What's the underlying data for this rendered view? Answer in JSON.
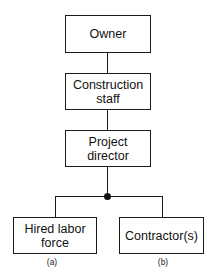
{
  "diagram": {
    "nodes": [
      {
        "id": "owner",
        "label": "Owner"
      },
      {
        "id": "construction_staff",
        "label": "Construction\nstaff"
      },
      {
        "id": "project_director",
        "label": "Project\ndirector"
      },
      {
        "id": "hired_labor_force",
        "label": "Hired labor\nforce"
      },
      {
        "id": "contractors",
        "label": "Contractor(s)"
      }
    ],
    "edges": [
      {
        "from": "owner",
        "to": "construction_staff"
      },
      {
        "from": "construction_staff",
        "to": "project_director"
      },
      {
        "from": "project_director",
        "to": "hired_labor_force"
      },
      {
        "from": "project_director",
        "to": "contractors"
      }
    ],
    "sublabels": {
      "a": "(a)",
      "b": "(b)"
    }
  }
}
